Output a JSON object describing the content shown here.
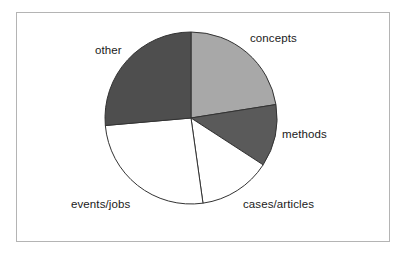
{
  "chart_data": {
    "type": "pie",
    "title": "",
    "subtitle": "",
    "xlabel": "",
    "ylabel": "",
    "grid": false,
    "legend_position": "none",
    "labels_position": "outside",
    "start_angle_deg": 0,
    "direction": "clockwise",
    "categories": [
      "concepts",
      "methods",
      "cases/articles",
      "events/jobs",
      "other"
    ],
    "values": [
      22.5,
      11.7,
      13.6,
      25.8,
      26.4
    ],
    "units": "percent",
    "slice_colors": [
      "#a8a8a8",
      "#5a5a5a",
      "#ffffff",
      "#ffffff",
      "#4e4e4e"
    ],
    "slice_edge_color": "#333333",
    "series": [
      {
        "name": "share",
        "values": [
          22.5,
          11.7,
          13.6,
          25.8,
          26.4
        ]
      }
    ],
    "slices": [
      {
        "label": "concepts",
        "value": 22.5,
        "start_deg": 0,
        "end_deg": 81,
        "color": "#a8a8a8"
      },
      {
        "label": "methods",
        "value": 11.7,
        "start_deg": 81,
        "end_deg": 123,
        "color": "#5a5a5a"
      },
      {
        "label": "cases/articles",
        "value": 13.6,
        "start_deg": 123,
        "end_deg": 172,
        "color": "#ffffff"
      },
      {
        "label": "events/jobs",
        "value": 25.8,
        "start_deg": 172,
        "end_deg": 265,
        "color": "#ffffff"
      },
      {
        "label": "other",
        "value": 26.4,
        "start_deg": 265,
        "end_deg": 360,
        "color": "#4e4e4e"
      }
    ],
    "geometry": {
      "center_x": 191,
      "center_y": 118,
      "radius": 86
    }
  },
  "chart": {
    "labels": {
      "concepts": "concepts",
      "methods": "methods",
      "cases_articles": "cases/articles",
      "events_jobs": "events/jobs",
      "other": "other"
    }
  },
  "frame": {
    "border_color": "#b4b4b4",
    "background": "#ffffff"
  }
}
